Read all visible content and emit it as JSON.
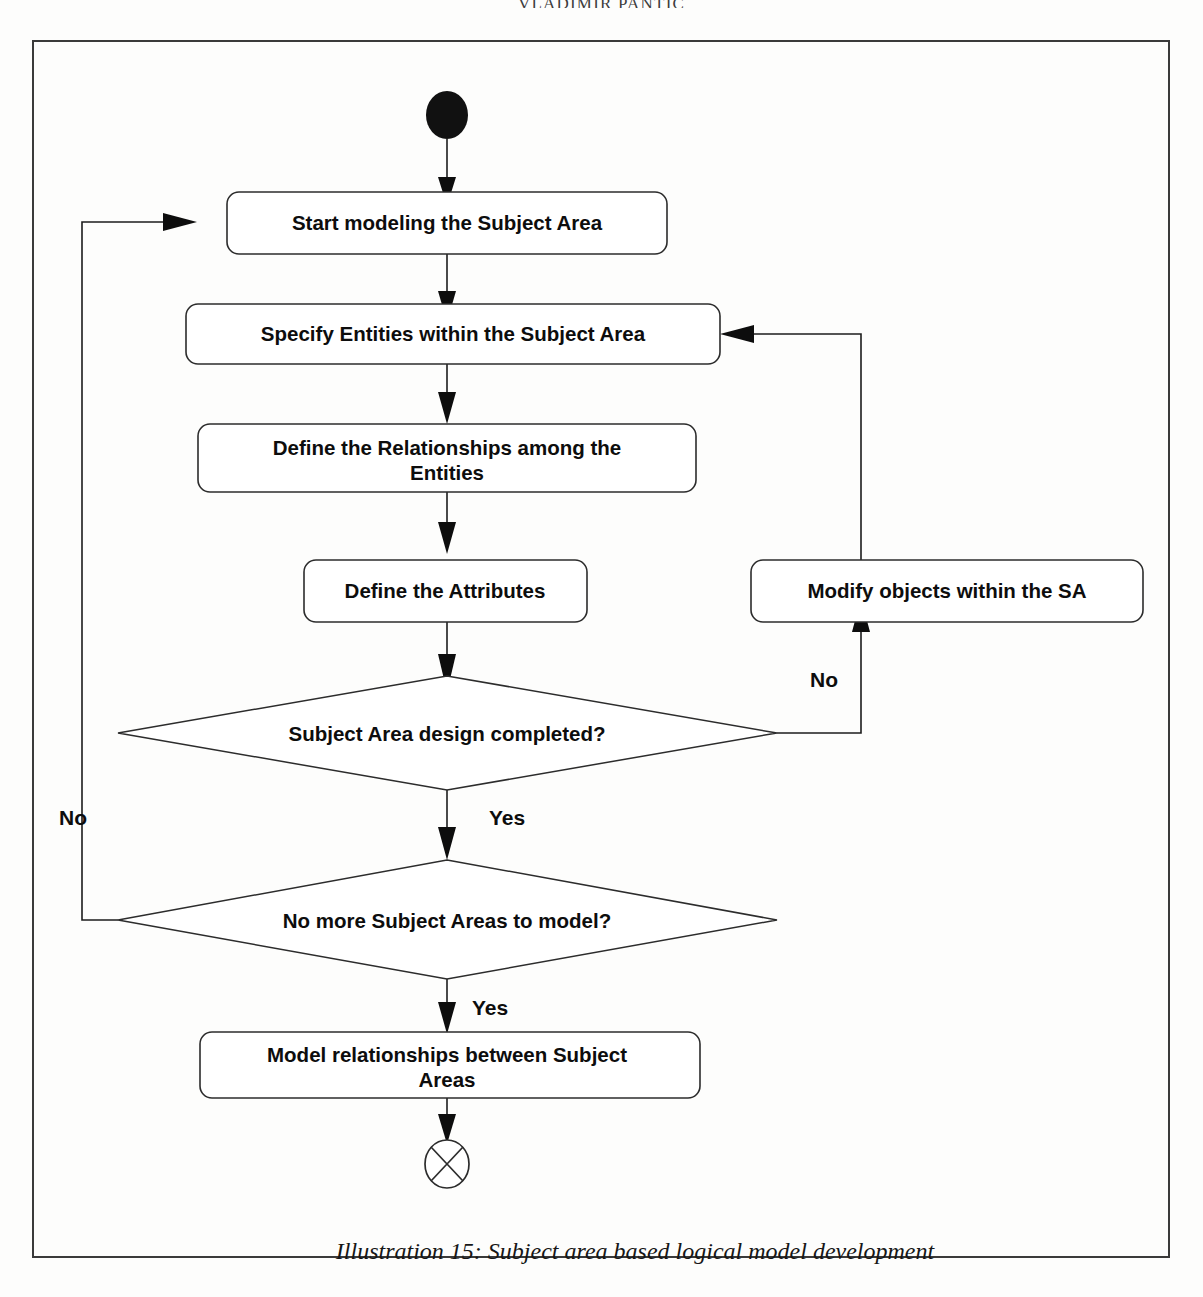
{
  "page": {
    "running_head": "VLADIMIR PANTIC",
    "caption": "Illustration 15: Subject area based logical model development",
    "background_color": "#fdfdfc",
    "frame_color": "#3a3a3a"
  },
  "diagram": {
    "type": "uml-activity-flowchart",
    "title": "Subject area based logical model development",
    "nodes": {
      "start": {
        "kind": "initial-node",
        "label": ""
      },
      "n1": {
        "kind": "action",
        "label": "Start modeling the Subject Area"
      },
      "n2": {
        "kind": "action",
        "label": "Specify Entities within the Subject Area"
      },
      "n3": {
        "kind": "action",
        "label": "Define the Relationships among the Entities",
        "line1": "Define the Relationships among the",
        "line2": "Entities"
      },
      "n4": {
        "kind": "action",
        "label": "Define the Attributes"
      },
      "n5": {
        "kind": "action",
        "label": "Modify objects within the SA"
      },
      "d1": {
        "kind": "decision",
        "label": "Subject Area design completed?"
      },
      "d2": {
        "kind": "decision",
        "label": "No more Subject Areas to model?"
      },
      "n6": {
        "kind": "action",
        "label": "Model relationships between Subject Areas",
        "line1": "Model relationships between Subject",
        "line2": "Areas"
      },
      "end": {
        "kind": "final-node",
        "label": ""
      }
    },
    "edge_labels": {
      "d1_no": "No",
      "d1_yes": "Yes",
      "d2_no": "No",
      "d2_yes": "Yes"
    },
    "edges": [
      {
        "from": "start",
        "to": "n1",
        "label": ""
      },
      {
        "from": "n1",
        "to": "n2",
        "label": ""
      },
      {
        "from": "n2",
        "to": "n3",
        "label": ""
      },
      {
        "from": "n3",
        "to": "n4",
        "label": ""
      },
      {
        "from": "n4",
        "to": "d1",
        "label": ""
      },
      {
        "from": "d1",
        "to": "n5",
        "label": "No"
      },
      {
        "from": "n5",
        "to": "n2",
        "label": ""
      },
      {
        "from": "d1",
        "to": "d2",
        "label": "Yes"
      },
      {
        "from": "d2",
        "to": "n1",
        "label": "No"
      },
      {
        "from": "d2",
        "to": "n6",
        "label": "Yes"
      },
      {
        "from": "n6",
        "to": "end",
        "label": ""
      }
    ]
  }
}
